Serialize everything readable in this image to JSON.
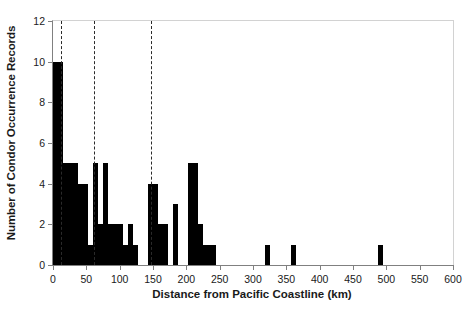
{
  "chart_data": {
    "type": "bar",
    "title": "",
    "xlabel": "Distance from Pacific Coastline (km)",
    "ylabel": "Number of Condor Occurrence Records",
    "xlim": [
      0,
      600
    ],
    "ylim": [
      0,
      12
    ],
    "xticks": [
      0,
      50,
      100,
      150,
      200,
      250,
      300,
      350,
      400,
      450,
      500,
      550,
      600
    ],
    "yticks": [
      0,
      2,
      4,
      6,
      8,
      10,
      12
    ],
    "grid": false,
    "legend": null,
    "bin_width": 7.5,
    "bar_color": "#000000",
    "annotations": {
      "reference_lines": {
        "style": "dashed",
        "color": "#2a2a2a",
        "x_values": [
          12,
          62,
          147
        ]
      }
    },
    "bins": [
      {
        "x0": 0,
        "x1": 15,
        "value": 10
      },
      {
        "x0": 15,
        "x1": 37.5,
        "value": 5
      },
      {
        "x0": 37.5,
        "x1": 52.5,
        "value": 4
      },
      {
        "x0": 52.5,
        "x1": 60,
        "value": 1
      },
      {
        "x0": 60,
        "x1": 67.5,
        "value": 5
      },
      {
        "x0": 67.5,
        "x1": 75,
        "value": 2
      },
      {
        "x0": 75,
        "x1": 82.5,
        "value": 5
      },
      {
        "x0": 82.5,
        "x1": 105,
        "value": 2
      },
      {
        "x0": 105,
        "x1": 112.5,
        "value": 1
      },
      {
        "x0": 112.5,
        "x1": 120,
        "value": 2
      },
      {
        "x0": 120,
        "x1": 127.5,
        "value": 1
      },
      {
        "x0": 127.5,
        "x1": 142.5,
        "value": 0
      },
      {
        "x0": 142.5,
        "x1": 157.5,
        "value": 4
      },
      {
        "x0": 157.5,
        "x1": 172.5,
        "value": 2
      },
      {
        "x0": 172.5,
        "x1": 180,
        "value": 0
      },
      {
        "x0": 180,
        "x1": 187.5,
        "value": 3
      },
      {
        "x0": 187.5,
        "x1": 202.5,
        "value": 0
      },
      {
        "x0": 202.5,
        "x1": 217.5,
        "value": 5
      },
      {
        "x0": 217.5,
        "x1": 225,
        "value": 2
      },
      {
        "x0": 225,
        "x1": 245,
        "value": 1
      },
      {
        "x0": 245,
        "x1": 315,
        "value": 0
      },
      {
        "x0": 318,
        "x1": 326,
        "value": 1
      },
      {
        "x0": 326,
        "x1": 355,
        "value": 0
      },
      {
        "x0": 357,
        "x1": 365,
        "value": 1
      },
      {
        "x0": 365,
        "x1": 485,
        "value": 0
      },
      {
        "x0": 487,
        "x1": 495,
        "value": 1
      }
    ]
  }
}
